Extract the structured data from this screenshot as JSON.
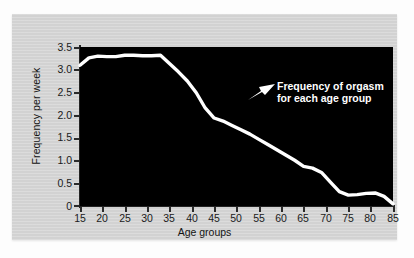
{
  "chart_data": {
    "type": "line",
    "title": "",
    "xlabel": "Age groups",
    "ylabel": "Frequency per week",
    "xlim": [
      15,
      85
    ],
    "ylim": [
      -0.15,
      3.5
    ],
    "xticks": [
      "15",
      "20",
      "25",
      "30",
      "35",
      "40",
      "45",
      "50",
      "55",
      "60",
      "65",
      "70",
      "75",
      "80",
      "85"
    ],
    "yticks": [
      "3.5",
      "3.0",
      "2.5",
      "2.0",
      "1.5",
      "1.0",
      "0.5",
      "0"
    ],
    "grid": false,
    "legend": "none",
    "series": [
      {
        "name": "Frequency of orgasm for each age group",
        "color": "#ffffff",
        "x": [
          15,
          17,
          19,
          21,
          23,
          25,
          27,
          29,
          31,
          33,
          35,
          37,
          39,
          41,
          43,
          45,
          47,
          49,
          51,
          53,
          55,
          57,
          59,
          61,
          63,
          65,
          67,
          69,
          71,
          73,
          75,
          77,
          79,
          81,
          83,
          85
        ],
        "values": [
          3.08,
          3.25,
          3.29,
          3.28,
          3.28,
          3.31,
          3.31,
          3.3,
          3.3,
          3.31,
          3.12,
          2.93,
          2.72,
          2.45,
          2.1,
          1.87,
          1.8,
          1.7,
          1.6,
          1.5,
          1.38,
          1.26,
          1.14,
          1.02,
          0.9,
          0.76,
          0.72,
          0.62,
          0.4,
          0.18,
          0.1,
          0.11,
          0.14,
          0.15,
          0.07,
          -0.1
        ]
      }
    ],
    "annotations": [
      {
        "name": "series-callout",
        "line1": "Frequency of orgasm",
        "line2": "for each age group",
        "arrow": "arrow-pointing-down-left"
      }
    ],
    "colors": {
      "plot_background": "#000000",
      "card_background": "#d2d2d2",
      "page_background": "#fdfdfd",
      "line": "#ffffff",
      "axis": "#232323",
      "text": "#141414"
    }
  }
}
